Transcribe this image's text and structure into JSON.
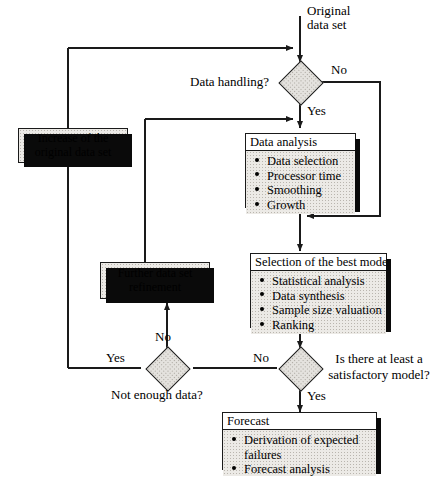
{
  "diagram": {
    "type": "flowchart",
    "accent_fill": "#eceae6",
    "line_color": "#1a1a1a"
  },
  "nodes": {
    "start": {
      "label_line1": "Original",
      "label_line2": "data set"
    },
    "decision_data_handling": {
      "label": "Data handling?",
      "yes": "Yes",
      "no": "No"
    },
    "increase_data": {
      "line1": "Increase of the",
      "line2": "original data set"
    },
    "data_analysis": {
      "header": "Data analysis",
      "items": [
        "Data selection",
        "Processor time",
        "Smoothing",
        "Growth"
      ]
    },
    "further_refinement": {
      "line1": "Further data set",
      "line2": "refinement"
    },
    "best_model": {
      "header": "Selection of the best model",
      "items": [
        "Statistical analysis",
        "Data synthesis",
        "Sample size valuation",
        "Ranking"
      ]
    },
    "decision_not_enough": {
      "label": "Not enough data?",
      "yes": "Yes",
      "no": "No"
    },
    "decision_satisfactory": {
      "label_line1": "Is there at least a",
      "label_line2": "satisfactory model?",
      "yes": "Yes",
      "no": "No"
    },
    "forecast": {
      "header": "Forecast",
      "items": [
        "Derivation of expected failures",
        "Forecast analysis"
      ],
      "item_wrapped_line1": "Derivation of expected",
      "item_wrapped_line2": "failures"
    }
  }
}
